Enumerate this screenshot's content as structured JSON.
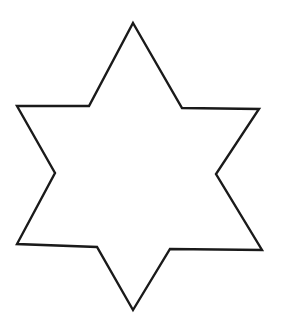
{
  "diagram": {
    "shape": "six-pointed-star",
    "stroke_color": "#1a1a1a",
    "fill_color": "#ffffff",
    "background": "#ffffff",
    "stroke_width": 2.4,
    "points": [
      [
        133,
        23
      ],
      [
        182,
        108
      ],
      [
        259,
        109
      ],
      [
        216,
        174
      ],
      [
        262,
        250
      ],
      [
        170,
        249
      ],
      [
        133,
        310
      ],
      [
        97,
        247
      ],
      [
        17,
        244
      ],
      [
        55,
        173
      ],
      [
        17,
        106
      ],
      [
        89,
        106
      ]
    ]
  }
}
